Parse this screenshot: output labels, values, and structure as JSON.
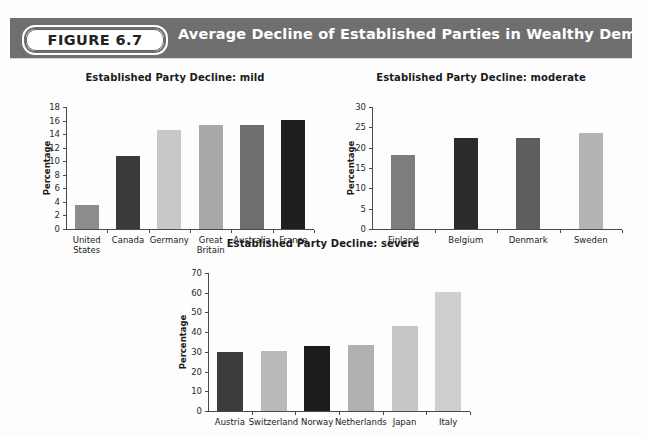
{
  "figure": {
    "badge_label": "FIGURE 6.7",
    "title": "Average Decline of Established Parties in Wealthy Democracies",
    "band_color": "#706f6f",
    "title_color": "#ffffff",
    "footnote": ""
  },
  "chart_data": [
    {
      "type": "bar",
      "id": "mild",
      "title": "Established Party Decline: mild",
      "xlabel": "",
      "ylabel": "Percentage",
      "ylim": [
        0,
        18
      ],
      "yticks": [
        0,
        2,
        4,
        6,
        8,
        10,
        12,
        14,
        16,
        18
      ],
      "grid": false,
      "legend": "none",
      "categories": [
        "United States",
        "Canada",
        "Germany",
        "Great Britain",
        "Australia",
        "France"
      ],
      "category_lines": [
        [
          "United",
          "States"
        ],
        [
          "Canada"
        ],
        [
          "Germany"
        ],
        [
          "Great",
          "Britain"
        ],
        [
          "Australia"
        ],
        [
          "France"
        ]
      ],
      "values": [
        3.5,
        10.7,
        14.6,
        15.3,
        15.4,
        16.1
      ],
      "colors": [
        "#8c8c8c",
        "#3a3a3a",
        "#c8c8c8",
        "#a8a8a8",
        "#6e6e6e",
        "#1f1f1f"
      ]
    },
    {
      "type": "bar",
      "id": "moderate",
      "title": "Established Party Decline: moderate",
      "xlabel": "",
      "ylabel": "Percentage",
      "ylim": [
        0,
        30
      ],
      "yticks": [
        0,
        5,
        10,
        15,
        20,
        25,
        30
      ],
      "grid": false,
      "legend": "none",
      "categories": [
        "Finland",
        "Belgium",
        "Denmark",
        "Sweden"
      ],
      "category_lines": [
        [
          "Finland"
        ],
        [
          "Belgium"
        ],
        [
          "Denmark"
        ],
        [
          "Sweden"
        ]
      ],
      "values": [
        18.3,
        22.3,
        22.5,
        23.7
      ],
      "colors": [
        "#7d7d7d",
        "#2b2b2b",
        "#5e5e5e",
        "#b4b4b4"
      ]
    },
    {
      "type": "bar",
      "id": "severe",
      "title": "Established Party Decline: severe",
      "xlabel": "",
      "ylabel": "Percentage",
      "ylim": [
        0,
        70
      ],
      "yticks": [
        0,
        10,
        20,
        30,
        40,
        50,
        60,
        70
      ],
      "grid": false,
      "legend": "none",
      "categories": [
        "Austria",
        "Switzerland",
        "Norway",
        "Netherlands",
        "Japan",
        "Italy"
      ],
      "category_lines": [
        [
          "Austria"
        ],
        [
          "Switzerland"
        ],
        [
          "Norway"
        ],
        [
          "Netherlands"
        ],
        [
          "Japan"
        ],
        [
          "Italy"
        ]
      ],
      "values": [
        30.0,
        30.2,
        33.0,
        33.5,
        43.0,
        60.2
      ],
      "colors": [
        "#3c3c3c",
        "#b9b9b9",
        "#1c1c1c",
        "#b0b0b0",
        "#c6c6c6",
        "#cfcfcf"
      ]
    }
  ]
}
